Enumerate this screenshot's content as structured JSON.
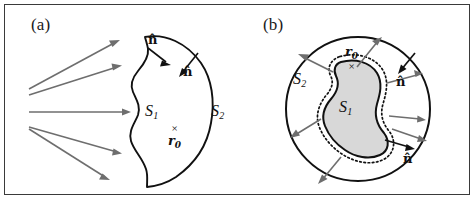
{
  "figure": {
    "type": "scientific-diagram",
    "background_color": "#ffffff",
    "frame_color": "#3a3a3a",
    "ray_color": "#6e6e6e",
    "contour_color": "#111111",
    "blob_fill_color": "#d8d8d8",
    "panels": [
      {
        "id": "a",
        "label": "(a)",
        "surfaces": [
          {
            "name": "S1",
            "base": "S",
            "sub": "1",
            "style": "wavy-open-contour"
          },
          {
            "name": "S2",
            "base": "S",
            "sub": "2",
            "style": "smooth-arc"
          }
        ],
        "normals": [
          {
            "name": "n-hat-upper",
            "label": "n̂",
            "direction": "inward-right-down"
          },
          {
            "name": "n-hat-inner",
            "label": "n̂",
            "direction": "inward-left-down"
          }
        ],
        "point": {
          "name": "r0",
          "base": "r",
          "sub": "0",
          "marker": "×",
          "marker_position": "above"
        },
        "rays": {
          "count": 5,
          "color": "#6e6e6e",
          "description": "Fan of gray arrows travelling left to right toward the surface"
        }
      },
      {
        "id": "b",
        "label": "(b)",
        "surfaces": [
          {
            "name": "S1",
            "base": "S",
            "sub": "1",
            "style": "dotted-blob-boundary"
          },
          {
            "name": "S2",
            "base": "S",
            "sub": "2",
            "style": "enclosing-circle"
          }
        ],
        "normals": [
          {
            "name": "n-hat-outer",
            "label": "n̂",
            "direction": "inward-from-circle"
          },
          {
            "name": "n-hat-inner",
            "label": "n̂",
            "direction": "outward-from-blob"
          }
        ],
        "point": {
          "name": "r0",
          "base": "r",
          "sub": "0",
          "marker": "×",
          "marker_position": "below"
        },
        "rays": {
          "count": 8,
          "color": "#6e6e6e",
          "description": "Gray arrows radiating outward from the inner blob toward the enclosing circle"
        }
      }
    ]
  }
}
